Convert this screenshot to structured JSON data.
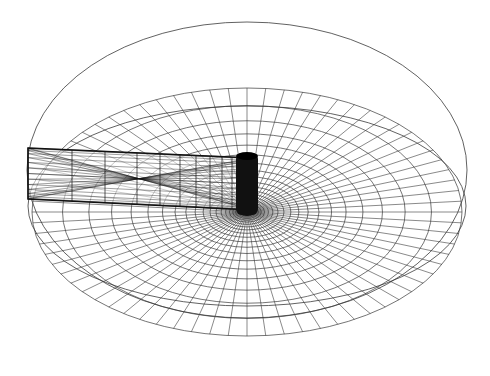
{
  "figure": {
    "kind": "3d-wireframe-mesh",
    "background": "#ffffff",
    "line_color": "#3a3a3a",
    "dense_color": "#111111",
    "outer_cylinder": {
      "top_rim": {
        "cx": 247,
        "cy": 170,
        "rx": 220,
        "ry": 148
      },
      "bottom_rim": {
        "cx": 247,
        "cy": 206,
        "rx": 219,
        "ry": 100
      }
    },
    "radial_mesh": {
      "center": {
        "x": 247,
        "y": 212
      },
      "outer": {
        "rx": 215,
        "ry": 124
      },
      "ring_count": 24,
      "spoke_count": 72,
      "growth": 1.16
    },
    "horizontal_pipe": {
      "x_start": 28,
      "x_end": 252,
      "top_start_y": 148,
      "top_end_y": 158,
      "bottom_start_y": 199,
      "bottom_end_y": 210,
      "axial_lines": 14,
      "sections": [
        28,
        72,
        105,
        137,
        160,
        180,
        196,
        210,
        222,
        232,
        240,
        246,
        250
      ]
    },
    "vertical_cylinder": {
      "x": 236,
      "y": 153,
      "width": 22,
      "height": 62
    }
  }
}
